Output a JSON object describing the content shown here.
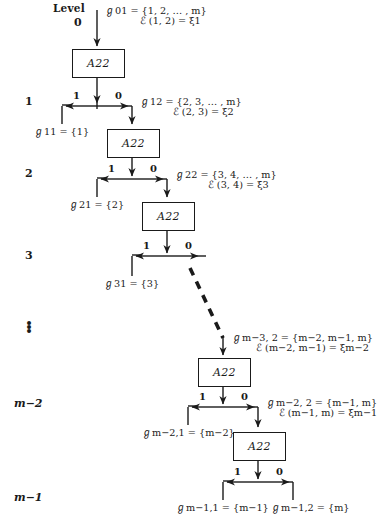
{
  "diagram": {
    "title_label": "Level",
    "box_label": "A22",
    "bit_one": "1",
    "bit_zero": "0",
    "vertical_ellipsis": "⋮",
    "levels": [
      {
        "id": "level-0",
        "label": "0"
      },
      {
        "id": "level-1",
        "label": "1"
      },
      {
        "id": "level-2",
        "label": "2"
      },
      {
        "id": "level-3",
        "label": "3"
      },
      {
        "id": "level-dots",
        "label": "⋮"
      },
      {
        "id": "level-m-2",
        "label": "m−2"
      },
      {
        "id": "level-m-1",
        "label": "m−1"
      }
    ],
    "input_annotations": [
      {
        "id": "ann-0",
        "set_line": "ℊ01 = {1, 2, … , m}",
        "script_line": "ℰ (1, 2) = ξ1",
        "set_symbol": "ℊ",
        "set_sub": "01",
        "set_value": "{1, 2, … , m}",
        "script_symbol": "ℰ",
        "script_args": "(1, 2)",
        "script_value": "ξ",
        "script_value_sub": "1"
      },
      {
        "id": "ann-1",
        "set_line": "ℊ12 = {2, 3, … , m}",
        "script_line": "ℰ (2, 3) = ξ2",
        "set_symbol": "ℊ",
        "set_sub": "12",
        "set_value": "{2, 3, … , m}",
        "script_symbol": "ℰ",
        "script_args": "(2, 3)",
        "script_value": "ξ",
        "script_value_sub": "2"
      },
      {
        "id": "ann-2",
        "set_line": "ℊ22 = {3, 4, … , m}",
        "script_line": "ℰ (3, 4) = ξ3",
        "set_symbol": "ℊ",
        "set_sub": "22",
        "set_value": "{3, 4, … , m}",
        "script_symbol": "ℰ",
        "script_args": "(3, 4)",
        "script_value": "ξ",
        "script_value_sub": "3"
      },
      {
        "id": "ann-m3",
        "set_line": "ℊm−3, 2 = {m−2, m−1, m}",
        "script_line": "ℰ (m−2, m−1) = ξm−2",
        "set_symbol": "ℊ",
        "set_sub": "m−3, 2",
        "set_value": "{m−2, m−1, m}",
        "script_symbol": "ℰ",
        "script_args": "(m−2, m−1)",
        "script_value": "ξ",
        "script_value_sub": "m−2"
      },
      {
        "id": "ann-m2",
        "set_line": "ℊm−2, 2 = {m−1, m}",
        "script_line": "ℰ (m−1, m) = ξm−1",
        "set_symbol": "ℊ",
        "set_sub": "m−2, 2",
        "set_value": "{m−1, m}",
        "script_symbol": "ℰ",
        "script_args": "(m−1, m)",
        "script_value": "ξ",
        "script_value_sub": "m−1"
      }
    ],
    "leaf_labels": [
      {
        "id": "leaf-11",
        "symbol": "ℊ",
        "sub": "11",
        "value": "= {1}",
        "text": "ℊ11 = {1}"
      },
      {
        "id": "leaf-21",
        "symbol": "ℊ",
        "sub": "21",
        "value": "= {2}",
        "text": "ℊ21 = {2}"
      },
      {
        "id": "leaf-31",
        "symbol": "ℊ",
        "sub": "31",
        "value": "= {3}",
        "text": "ℊ31 = {3}"
      },
      {
        "id": "leaf-m21",
        "symbol": "ℊ",
        "sub": "m−2, 1",
        "value": "= {m−2}",
        "text": "ℊm−2,1 = {m−2}"
      },
      {
        "id": "leaf-m11",
        "symbol": "ℊ",
        "sub": "m−1, 1",
        "value": "= {m−1}",
        "text": "ℊm−1,1 = {m−1}"
      },
      {
        "id": "leaf-m12",
        "symbol": "ℊ",
        "sub": "m−1, 2",
        "value": "= {m}",
        "text": "ℊm−1,2 = {m}"
      }
    ],
    "boxes": [
      {
        "id": "box-0",
        "label": "A22"
      },
      {
        "id": "box-1",
        "label": "A22"
      },
      {
        "id": "box-2",
        "label": "A22"
      },
      {
        "id": "box-3",
        "label": "A22"
      },
      {
        "id": "box-4",
        "label": "A22"
      }
    ],
    "colors": {
      "ink": "#1a1a1a",
      "paper": "#ffffff"
    }
  }
}
